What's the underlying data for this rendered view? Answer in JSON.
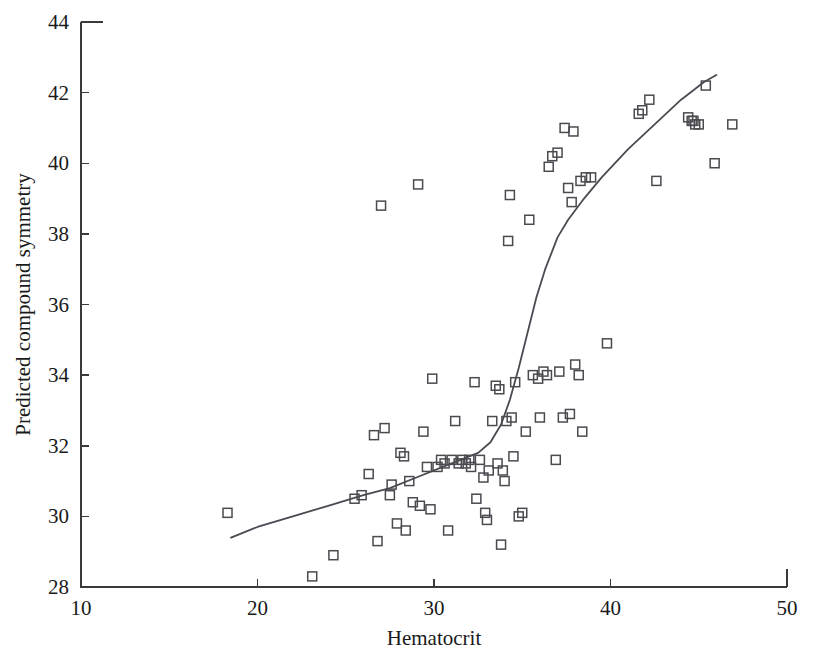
{
  "figure": {
    "background": "#ffffff",
    "marker_color": "#4a4a50",
    "curve_color": "#4a4a52",
    "axis_color": "#3a3a3a"
  },
  "chart_data": {
    "type": "scatter",
    "title": "",
    "xlabel": "Hematocrit",
    "ylabel": "Predicted compound symmetry",
    "xlim": [
      10,
      50
    ],
    "ylim": [
      28,
      44
    ],
    "xticks": [
      10,
      20,
      30,
      40,
      50
    ],
    "yticks": [
      28,
      30,
      32,
      34,
      36,
      38,
      40,
      42,
      44
    ],
    "xtick_labels": [
      "10",
      "20",
      "30",
      "40",
      "50"
    ],
    "ytick_labels": [
      "28",
      "30",
      "32",
      "34",
      "36",
      "38",
      "40",
      "42",
      "44"
    ],
    "grid": false,
    "legend": null,
    "marker_style": "open-square",
    "series": [
      {
        "name": "observations",
        "points": [
          [
            18.3,
            30.1
          ],
          [
            23.1,
            28.3
          ],
          [
            24.3,
            28.9
          ],
          [
            25.5,
            30.5
          ],
          [
            25.9,
            30.6
          ],
          [
            26.3,
            31.2
          ],
          [
            26.6,
            32.3
          ],
          [
            26.8,
            29.3
          ],
          [
            27.0,
            38.8
          ],
          [
            27.2,
            32.5
          ],
          [
            27.5,
            30.6
          ],
          [
            27.6,
            30.9
          ],
          [
            27.9,
            29.8
          ],
          [
            28.1,
            31.8
          ],
          [
            28.3,
            31.7
          ],
          [
            28.4,
            29.6
          ],
          [
            28.6,
            31.0
          ],
          [
            28.8,
            30.4
          ],
          [
            29.1,
            39.4
          ],
          [
            29.2,
            30.3
          ],
          [
            29.4,
            32.4
          ],
          [
            29.6,
            31.4
          ],
          [
            29.8,
            30.2
          ],
          [
            29.9,
            33.9
          ],
          [
            30.2,
            31.4
          ],
          [
            30.4,
            31.6
          ],
          [
            30.6,
            31.5
          ],
          [
            30.8,
            29.6
          ],
          [
            31.0,
            31.6
          ],
          [
            31.2,
            32.7
          ],
          [
            31.4,
            31.5
          ],
          [
            31.6,
            31.6
          ],
          [
            31.8,
            31.5
          ],
          [
            32.0,
            31.6
          ],
          [
            32.1,
            31.4
          ],
          [
            32.3,
            33.8
          ],
          [
            32.4,
            30.5
          ],
          [
            32.6,
            31.6
          ],
          [
            32.8,
            31.1
          ],
          [
            32.9,
            30.1
          ],
          [
            33.0,
            29.9
          ],
          [
            33.1,
            31.3
          ],
          [
            33.3,
            32.7
          ],
          [
            33.5,
            33.7
          ],
          [
            33.6,
            31.5
          ],
          [
            33.7,
            33.6
          ],
          [
            33.8,
            29.2
          ],
          [
            33.9,
            31.3
          ],
          [
            34.0,
            31.0
          ],
          [
            34.1,
            32.7
          ],
          [
            34.2,
            37.8
          ],
          [
            34.3,
            39.1
          ],
          [
            34.4,
            32.8
          ],
          [
            34.5,
            31.7
          ],
          [
            34.6,
            33.8
          ],
          [
            34.8,
            30.0
          ],
          [
            35.0,
            30.1
          ],
          [
            35.2,
            32.4
          ],
          [
            35.4,
            38.4
          ],
          [
            35.6,
            34.0
          ],
          [
            35.9,
            33.9
          ],
          [
            36.0,
            32.8
          ],
          [
            36.2,
            34.1
          ],
          [
            36.4,
            34.0
          ],
          [
            36.5,
            39.9
          ],
          [
            36.7,
            40.2
          ],
          [
            36.9,
            31.6
          ],
          [
            37.0,
            40.3
          ],
          [
            37.1,
            34.1
          ],
          [
            37.3,
            32.8
          ],
          [
            37.4,
            41.0
          ],
          [
            37.6,
            39.3
          ],
          [
            37.7,
            32.9
          ],
          [
            37.8,
            38.9
          ],
          [
            37.9,
            40.9
          ],
          [
            38.0,
            34.3
          ],
          [
            38.2,
            34.0
          ],
          [
            38.3,
            39.5
          ],
          [
            38.4,
            32.4
          ],
          [
            38.6,
            39.6
          ],
          [
            38.9,
            39.6
          ],
          [
            39.8,
            34.9
          ],
          [
            41.6,
            41.4
          ],
          [
            41.8,
            41.5
          ],
          [
            42.2,
            41.8
          ],
          [
            42.6,
            39.5
          ],
          [
            44.4,
            41.3
          ],
          [
            44.6,
            41.2
          ],
          [
            44.7,
            41.2
          ],
          [
            44.8,
            41.1
          ],
          [
            45.0,
            41.1
          ],
          [
            45.4,
            42.2
          ],
          [
            45.9,
            40.0
          ],
          [
            46.9,
            41.1
          ]
        ]
      }
    ],
    "fit_curve": {
      "name": "smoothed-fit",
      "points": [
        [
          18.5,
          29.4
        ],
        [
          20.0,
          29.7
        ],
        [
          22.0,
          30.0
        ],
        [
          24.0,
          30.3
        ],
        [
          26.0,
          30.6
        ],
        [
          27.5,
          30.8
        ],
        [
          29.0,
          31.1
        ],
        [
          30.5,
          31.4
        ],
        [
          31.5,
          31.6
        ],
        [
          32.5,
          31.8
        ],
        [
          33.2,
          32.1
        ],
        [
          33.8,
          32.6
        ],
        [
          34.3,
          33.3
        ],
        [
          34.8,
          34.2
        ],
        [
          35.3,
          35.2
        ],
        [
          35.8,
          36.2
        ],
        [
          36.3,
          37.0
        ],
        [
          37.0,
          37.9
        ],
        [
          37.6,
          38.4
        ],
        [
          38.5,
          39.0
        ],
        [
          39.5,
          39.6
        ],
        [
          41.0,
          40.4
        ],
        [
          42.5,
          41.1
        ],
        [
          44.0,
          41.8
        ],
        [
          45.3,
          42.3
        ],
        [
          46.0,
          42.5
        ]
      ]
    }
  }
}
